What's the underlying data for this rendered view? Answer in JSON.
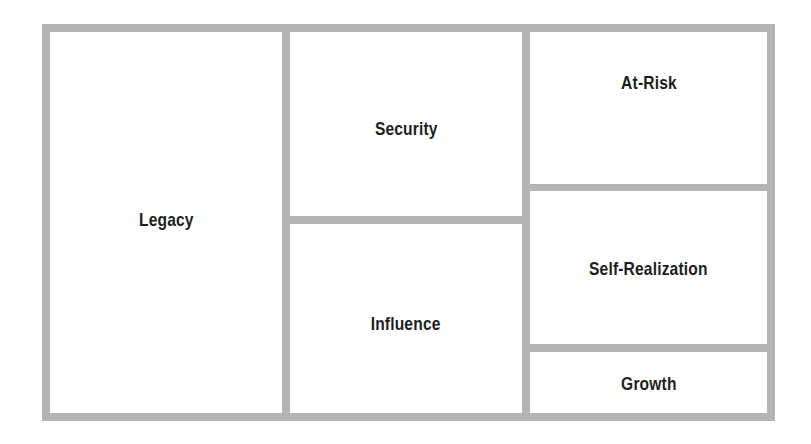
{
  "diagram": {
    "type": "treemap-style-box-diagram",
    "colors": {
      "border": "#b4b4b4",
      "cell_background": "#ffffff",
      "label_text": "#1e1e1e"
    },
    "cells": {
      "legacy": {
        "label": "Legacy"
      },
      "security": {
        "label": "Security"
      },
      "influence": {
        "label": "Influence"
      },
      "at_risk": {
        "label": "At-Risk"
      },
      "self_realization": {
        "label": "Self-Realization"
      },
      "growth": {
        "label": "Growth"
      }
    }
  }
}
